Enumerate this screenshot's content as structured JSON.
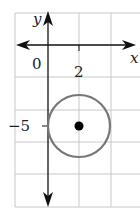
{
  "diagram": {
    "type": "coordinate-plane-circle",
    "axes": {
      "x_label": "x",
      "y_label": "y",
      "origin_label": "0",
      "x_tick_label": "2",
      "y_tick_label": "−5"
    },
    "grid": {
      "unit_per_cell": 2,
      "color": "#c8c8c8"
    },
    "circle": {
      "center": [
        2,
        -5
      ],
      "radius": 2,
      "stroke": "#777777"
    },
    "center_point": {
      "x": 2,
      "y": -5,
      "color": "#000000"
    }
  }
}
